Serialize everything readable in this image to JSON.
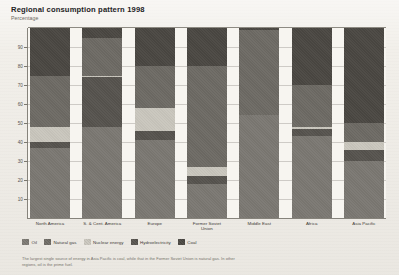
{
  "header": {
    "title": "Regional consumption pattern 1998",
    "subtitle": "Percentage"
  },
  "footnote": "The largest single source of energy in Asia Pacific is coal, while that in the Former Soviet Union is natural gas. In other regions, oil is the prime fuel.",
  "colors": {
    "oil": "#7b7872",
    "natural_gas": "#6d6a64",
    "nuclear_energy": "#c9c6bd",
    "hydroelectricity": "#56534e",
    "coal": "#4a4742",
    "axis": "#86837b",
    "grid": "#a9a69e",
    "plot_background": "#f7f5f0",
    "page_background": "#efece6"
  },
  "chart_data": {
    "type": "bar",
    "subtype": "stacked-bar-100",
    "title": "Regional consumption pattern 1998",
    "subtitle": "Percentage",
    "xlabel": "",
    "ylabel": "Percentage",
    "ylim": [
      0,
      100
    ],
    "yticks": [
      10,
      20,
      30,
      40,
      50,
      60,
      70,
      80,
      90
    ],
    "ytick_labels": [
      "10",
      "20",
      "30",
      "40",
      "50",
      "60",
      "70",
      "80",
      "90"
    ],
    "grid": true,
    "legend_position": "bottom-left",
    "stack_order_top_to_bottom": [
      "Coal",
      "Natural gas",
      "Nuclear energy",
      "Hydroelectricity",
      "Oil"
    ],
    "categories": [
      "North America",
      "S. & Cent. America",
      "Europe",
      "Former Soviet Union",
      "Middle East",
      "Africa",
      "Asia Pacific"
    ],
    "series": [
      {
        "name": "Coal",
        "values": [
          25,
          5,
          20,
          20,
          1,
          30,
          50
        ]
      },
      {
        "name": "Natural gas",
        "values": [
          27,
          20,
          22,
          53,
          45,
          22,
          10
        ]
      },
      {
        "name": "Nuclear energy",
        "values": [
          8,
          1,
          12,
          5,
          0,
          1,
          4
        ]
      },
      {
        "name": "Hydroelectricity",
        "values": [
          3,
          26,
          5,
          4,
          0,
          4,
          6
        ]
      },
      {
        "name": "Oil",
        "values": [
          37,
          48,
          41,
          18,
          54,
          43,
          30
        ]
      }
    ]
  },
  "legend": [
    {
      "label": "Oil",
      "icon": "legend-swatch-oil",
      "color": "#7b7872"
    },
    {
      "label": "Natural gas",
      "icon": "legend-swatch-natural-gas",
      "color": "#6d6a64"
    },
    {
      "label": "Nuclear energy",
      "icon": "legend-swatch-nuclear-energy",
      "color": "#c9c6bd"
    },
    {
      "label": "Hydroelectricity",
      "icon": "legend-swatch-hydroelectricity",
      "color": "#56534e"
    },
    {
      "label": "Coal",
      "icon": "legend-swatch-coal",
      "color": "#4a4742"
    }
  ]
}
